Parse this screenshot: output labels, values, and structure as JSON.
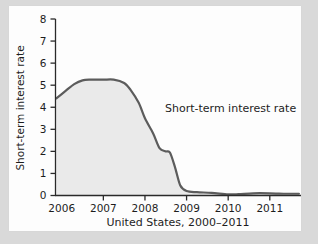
{
  "chart_data": {
    "type": "area",
    "title": "",
    "subtitle": "",
    "xlabel": "United States, 2000–2011",
    "ylabel": "Short-term interest rate",
    "xlim": [
      2005.85,
      2011.75
    ],
    "ylim": [
      0,
      8
    ],
    "grid": false,
    "legend_position": "none",
    "annotations": [
      {
        "text": "Short-term interest rate",
        "x": 2008.35,
        "y": 3.85
      }
    ],
    "xticks": [
      2006,
      2007,
      2008,
      2009,
      2010,
      2011
    ],
    "xtick_labels": [
      "2006",
      "2007",
      "2008",
      "2009",
      "2010",
      "2011"
    ],
    "yticks": [
      0,
      1,
      2,
      3,
      4,
      5,
      6,
      7,
      8
    ],
    "ytick_labels": [
      "0",
      "1",
      "2",
      "3",
      "4",
      "5",
      "6",
      "7",
      "8"
    ],
    "series": [
      {
        "name": "Short-term interest rate",
        "line_color": "#5c5c5c",
        "fill_color": "#eaeaea",
        "x": [
          2005.87,
          2006.1,
          2006.3,
          2006.5,
          2006.7,
          2007.0,
          2007.25,
          2007.5,
          2007.65,
          2007.85,
          2008.0,
          2008.2,
          2008.35,
          2008.5,
          2008.6,
          2008.72,
          2008.85,
          2009.0,
          2009.25,
          2009.6,
          2010.0,
          2010.25,
          2010.6,
          2011.0,
          2011.4,
          2011.7
        ],
        "y": [
          4.4,
          4.75,
          5.05,
          5.22,
          5.25,
          5.25,
          5.25,
          5.1,
          4.8,
          4.2,
          3.5,
          2.8,
          2.15,
          2.0,
          1.95,
          1.3,
          0.45,
          0.2,
          0.15,
          0.12,
          0.05,
          0.06,
          0.1,
          0.1,
          0.08,
          0.08
        ]
      }
    ],
    "colors": {
      "line": "#5c5c5c",
      "fill": "#eaeaea",
      "axis": "#2a2a2a",
      "text": "#1d1d1d",
      "page": "#fdfdfd",
      "background": "#d9d9d9"
    }
  }
}
